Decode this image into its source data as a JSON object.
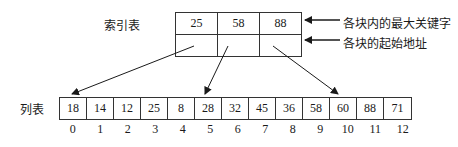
{
  "index_table": {
    "label": "索引表",
    "max_keys": [
      "25",
      "58",
      "88"
    ],
    "start_addresses": [
      "",
      "",
      ""
    ]
  },
  "annotations": {
    "max_key_label": "各块内的最大关键字",
    "start_addr_label": "各块的起始地址"
  },
  "list": {
    "label": "列表",
    "values": [
      "18",
      "14",
      "12",
      "25",
      "8",
      "28",
      "32",
      "45",
      "36",
      "58",
      "60",
      "88",
      "71"
    ],
    "indices": [
      "0",
      "1",
      "2",
      "3",
      "4",
      "5",
      "6",
      "7",
      "8",
      "9",
      "10",
      "11",
      "12"
    ]
  },
  "pointers": [
    {
      "from_block": 0,
      "to_index": 0
    },
    {
      "from_block": 1,
      "to_index": 5
    },
    {
      "from_block": 2,
      "to_index": 10
    }
  ],
  "colors": {
    "line": "#1a1a1a",
    "background": "#ffffff"
  }
}
